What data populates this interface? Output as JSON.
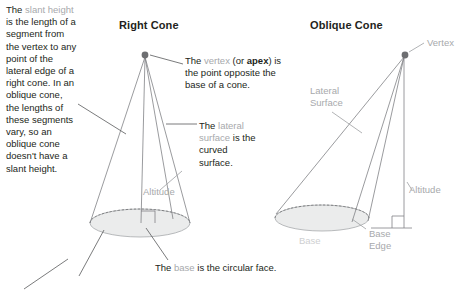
{
  "diagram": {
    "titles": {
      "right_cone": "Right Cone",
      "oblique_cone": "Oblique Cone"
    },
    "left_paragraph": {
      "lead": "The ",
      "term": "slant height",
      "rest": " is the length of a segment from the vertex to any point of the lateral edge of a right cone. In an oblique cone, the lengths of these segments vary, so an oblique cone doesn't have a slant height.",
      "full": "The slant height is the length of a segment from the vertex to any point of the lateral edge of a right cone. In an oblique cone, the lengths of these segments vary, so an oblique cone doesn't have a slant height."
    },
    "vertex_note": {
      "lead": "The ",
      "term": "vertex",
      "mid": " (or ",
      "bold_term": "apex",
      "rest": ") is the point opposite the base of a cone."
    },
    "lateral_note": {
      "lead": "The ",
      "term": "lateral surface",
      "rest": " is the curved surface."
    },
    "base_caption": {
      "lead": "The ",
      "term": "base",
      "rest": " is the circular face."
    },
    "labels": {
      "vertex": "Vertex",
      "lateral_surface": "Lateral\nSurface",
      "base_edge": "Base\nEdge",
      "altitude_right": "Altitude",
      "altitude_oblique": "Altitude",
      "base_oblique": "Base"
    },
    "colors": {
      "text": "#231f20",
      "term_gray": "#a7a9ac",
      "line": "#58595b",
      "cone_stroke": "#808285",
      "base_fill": "#ebecec",
      "vertex_dot": "#6d6e71",
      "background": "#ffffff"
    },
    "geometry": {
      "right_cone": {
        "apex": [
          145,
          55
        ],
        "base_center": [
          140,
          223
        ],
        "base_rx": 50,
        "base_ry": 14
      },
      "oblique_cone": {
        "apex": [
          405,
          55
        ],
        "base_center": [
          322,
          218
        ],
        "base_rx": 47,
        "base_ry": 13
      }
    }
  }
}
